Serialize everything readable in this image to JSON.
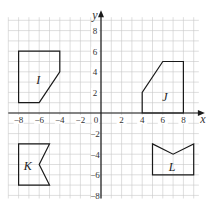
{
  "grid": {
    "x_min": -9,
    "x_max": 9.5,
    "y_min": -8.3,
    "y_max": 9.3,
    "unit_px": 10.3,
    "origin_px": [
      101,
      113
    ],
    "grid_color": "#c8c8c8",
    "axis_color": "#1a1a1a",
    "shape_color": "#1a1a1a"
  },
  "axes": {
    "x_label": "x",
    "y_label": "y",
    "origin_label": "0",
    "x_ticks": [
      {
        "value": -8,
        "label": "−8"
      },
      {
        "value": -6,
        "label": "−6"
      },
      {
        "value": -4,
        "label": "−4"
      },
      {
        "value": -2,
        "label": "−2"
      },
      {
        "value": 2,
        "label": "2"
      },
      {
        "value": 4,
        "label": "4"
      },
      {
        "value": 6,
        "label": "6"
      },
      {
        "value": 8,
        "label": "8"
      }
    ],
    "y_ticks": [
      {
        "value": 8,
        "label": "8"
      },
      {
        "value": 6,
        "label": "6"
      },
      {
        "value": 4,
        "label": "4"
      },
      {
        "value": 2,
        "label": "2"
      },
      {
        "value": -2,
        "label": "−2"
      },
      {
        "value": -4,
        "label": "−4"
      },
      {
        "value": -6,
        "label": "−6"
      },
      {
        "value": -8,
        "label": "−8"
      }
    ]
  },
  "shapes": [
    {
      "name": "I",
      "label_pos": [
        -6.1,
        3.2
      ],
      "points": [
        [
          -8,
          1
        ],
        [
          -8,
          6
        ],
        [
          -4,
          6
        ],
        [
          -4,
          4
        ],
        [
          -6,
          1
        ]
      ]
    },
    {
      "name": "J",
      "label_pos": [
        6.2,
        1.6
      ],
      "points": [
        [
          4,
          0
        ],
        [
          4,
          2
        ],
        [
          6,
          5
        ],
        [
          8,
          5
        ],
        [
          8,
          0
        ]
      ]
    },
    {
      "name": "K",
      "label_pos": [
        -7.1,
        -5.1
      ],
      "points": [
        [
          -8,
          -3
        ],
        [
          -8,
          -7
        ],
        [
          -5,
          -7
        ],
        [
          -6,
          -5
        ],
        [
          -5,
          -3
        ]
      ]
    },
    {
      "name": "L",
      "label_pos": [
        6.9,
        -5.2
      ],
      "points": [
        [
          5,
          -3
        ],
        [
          7,
          -4
        ],
        [
          9,
          -3
        ],
        [
          9,
          -6
        ],
        [
          5,
          -6
        ]
      ]
    }
  ]
}
